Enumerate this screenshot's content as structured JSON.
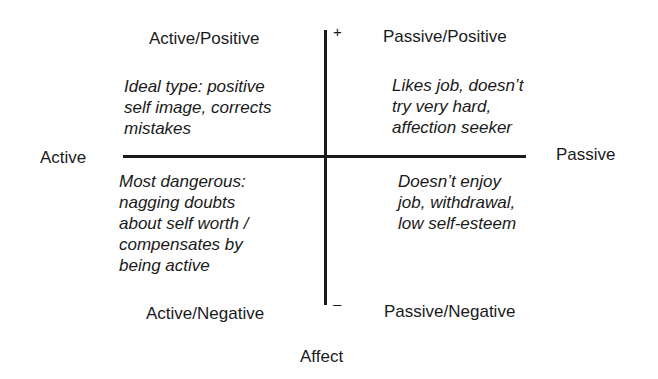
{
  "diagram": {
    "type": "quadrant",
    "axes": {
      "horizontal": {
        "left_label": "Active",
        "right_label": "Passive"
      },
      "vertical": {
        "top_mark": "+",
        "bottom_mark": "–",
        "label": "Affect"
      }
    },
    "quadrants": [
      {
        "position": "top-left",
        "title": "Active/Positive",
        "description": "Ideal type: positive\nself image, corrects\nmistakes"
      },
      {
        "position": "top-right",
        "title": "Passive/Positive",
        "description": "Likes job, doesn’t\ntry very hard,\naffection seeker"
      },
      {
        "position": "bottom-left",
        "title": "Active/Negative",
        "description": "Most dangerous:\nnagging doubts\nabout self worth /\ncompensates by\nbeing active"
      },
      {
        "position": "bottom-right",
        "title": "Passive/Negative",
        "description": "Doesn’t enjoy\njob, withdrawal,\nlow self-esteem"
      }
    ],
    "colors": {
      "ink": "#1a1a1a",
      "background": "#ffffff"
    }
  }
}
